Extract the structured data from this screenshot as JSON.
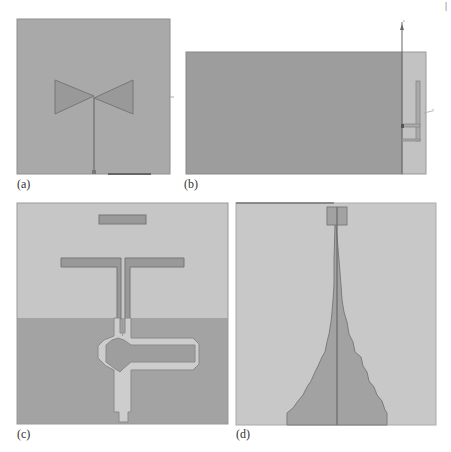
{
  "page_marker": "|",
  "colors": {
    "background": "#ffffff",
    "substrate": "#a9a9a9",
    "substrate_light": "#c4c4c4",
    "ground": "#a2a2a2",
    "metal": "#979797",
    "metal_edge": "#777777",
    "ground_dark": "#9c9c9c",
    "trace_light": "#cdcdcd",
    "axis": "#666666",
    "label": "#333333"
  },
  "panels": [
    {
      "id": "a",
      "label": "(a)",
      "description": "Bowtie antenna with microstrip feed line on substrate"
    },
    {
      "id": "b",
      "label": "(b)",
      "description": "Side view with ground plane and L-shaped feed strip, z and y axes"
    },
    {
      "id": "c",
      "label": "(c)",
      "description": "Quasi-Yagi dipole antenna with director and balun loop on partial ground"
    },
    {
      "id": "d",
      "label": "(d)",
      "description": "Stepped tapered (staircase) antenna with top rectangular patch and center feed line"
    }
  ],
  "axes": {
    "b_vertical": "z",
    "b_horizontal": "y"
  }
}
